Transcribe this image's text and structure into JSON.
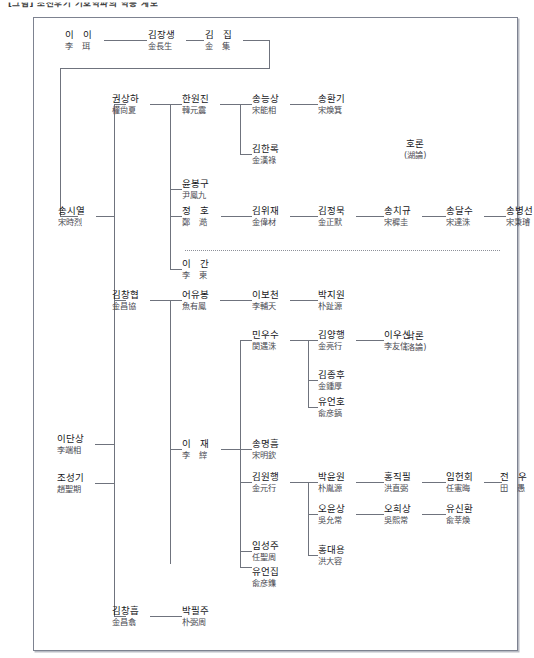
{
  "document": {
    "title": "[그림] 조선후기 기호학파의 학통 계보"
  },
  "side_labels": [
    {
      "id": "horon",
      "korean": "호론",
      "hanja": "(湖論)",
      "x": 404,
      "y": 138
    },
    {
      "id": "nakron",
      "korean": "낙론",
      "hanja": "(洛論)",
      "x": 404,
      "y": 330
    }
  ],
  "nodes": {
    "yi_i": {
      "korean": "이 이",
      "hanja": "李 珥",
      "spaced": true
    },
    "kim_jangsaeng": {
      "korean": "김장생",
      "hanja": "金長生",
      "spaced": false
    },
    "kim_jip": {
      "korean": "김 집",
      "hanja": "金 集",
      "spaced": true
    },
    "song_siyeol": {
      "korean": "송시열",
      "hanja": "宋時烈",
      "spaced": false
    },
    "gwon_sangha": {
      "korean": "권상하",
      "hanja": "權尙夏",
      "spaced": false
    },
    "han_wonjin": {
      "korean": "한원진",
      "hanja": "韓元震",
      "spaced": false
    },
    "song_neungsang": {
      "korean": "송능상",
      "hanja": "宋能相",
      "spaced": false
    },
    "song_hwangi": {
      "korean": "송환기",
      "hanja": "宋煥箕",
      "spaced": false
    },
    "kim_hannok": {
      "korean": "김한록",
      "hanja": "金漢祿",
      "spaced": false
    },
    "yun_bonggu": {
      "korean": "윤봉구",
      "hanja": "尹鳳九",
      "spaced": false
    },
    "jeong_ho": {
      "korean": "정 호",
      "hanja": "鄭 澔",
      "spaced": true
    },
    "kim_wijae": {
      "korean": "김위재",
      "hanja": "金偉材",
      "spaced": false
    },
    "kim_jeongmuk": {
      "korean": "김정묵",
      "hanja": "金正默",
      "spaced": false
    },
    "song_chigyu": {
      "korean": "송치규",
      "hanja": "宋穉圭",
      "spaced": false
    },
    "song_dalsu": {
      "korean": "송달수",
      "hanja": "宋達洙",
      "spaced": false
    },
    "song_byeongseon": {
      "korean": "송병선",
      "hanja": "宋秉璿",
      "spaced": false
    },
    "yi_gan": {
      "korean": "이 간",
      "hanja": "李 柬",
      "spaced": true
    },
    "kim_changhyeop": {
      "korean": "김창협",
      "hanja": "金昌協",
      "spaced": false
    },
    "eo_yubong": {
      "korean": "어유봉",
      "hanja": "魚有鳳",
      "spaced": false
    },
    "yi_bocheon": {
      "korean": "이보천",
      "hanja": "李輔天",
      "spaced": false
    },
    "park_jiwon": {
      "korean": "박지원",
      "hanja": "朴趾源",
      "spaced": false
    },
    "min_usu": {
      "korean": "민우수",
      "hanja": "閔遇洙",
      "spaced": false
    },
    "kim_yanghaeng": {
      "korean": "김양행",
      "hanja": "金亮行",
      "spaced": false
    },
    "yi_usin": {
      "korean": "이우신",
      "hanja": "李友信",
      "spaced": false
    },
    "kim_jonghu": {
      "korean": "김종후",
      "hanja": "金鍾厚",
      "spaced": false
    },
    "yu_eonho": {
      "korean": "유언호",
      "hanja": "兪彦鎬",
      "spaced": false
    },
    "yi_jae": {
      "korean": "이 재",
      "hanja": "李 縡",
      "spaced": true
    },
    "song_myeongheum": {
      "korean": "송명흠",
      "hanja": "宋明欽",
      "spaced": false
    },
    "kim_wonhaeng": {
      "korean": "김원행",
      "hanja": "金元行",
      "spaced": false
    },
    "park_yunwon": {
      "korean": "박윤원",
      "hanja": "朴胤源",
      "spaced": false
    },
    "hong_jikpil": {
      "korean": "홍직필",
      "hanja": "洪直弼",
      "spaced": false
    },
    "im_heonhoe": {
      "korean": "임헌회",
      "hanja": "任憲晦",
      "spaced": false
    },
    "jeon_u": {
      "korean": "전 우",
      "hanja": "田 愚",
      "spaced": true
    },
    "o_yunsang": {
      "korean": "오윤상",
      "hanja": "吳允常",
      "spaced": false
    },
    "o_huisang": {
      "korean": "오희상",
      "hanja": "吳熙常",
      "spaced": false
    },
    "yu_sinhwan": {
      "korean": "유신환",
      "hanja": "兪莘煥",
      "spaced": false
    },
    "hong_daeyong": {
      "korean": "홍대용",
      "hanja": "洪大容",
      "spaced": false
    },
    "im_seongju": {
      "korean": "임성주",
      "hanja": "任聖周",
      "spaced": false
    },
    "yu_eonjip": {
      "korean": "유언집",
      "hanja": "兪彦鏶",
      "spaced": false
    },
    "yi_dansang": {
      "korean": "이단상",
      "hanja": "李端相",
      "spaced": false
    },
    "jo_seonggi": {
      "korean": "조성기",
      "hanja": "趙聖期",
      "spaced": false
    },
    "kim_changheup": {
      "korean": "김창흡",
      "hanja": "金昌翕",
      "spaced": false
    },
    "park_pilju": {
      "korean": "박필주",
      "hanja": "朴弼周",
      "spaced": false
    }
  },
  "colors": {
    "ink": "#17171b",
    "ink_secondary": "#4a4a52",
    "line": "#6f737d",
    "frame": "#7d8290",
    "dotted": "#8d9099",
    "background": "#ffffff"
  }
}
